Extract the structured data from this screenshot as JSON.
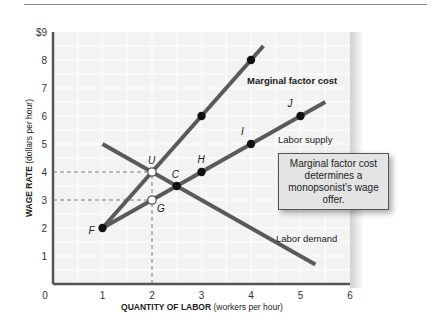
{
  "chart_data": {
    "type": "line",
    "title": "",
    "xlabel": "QUANTITY OF LABOR (workers per hour)",
    "xlabel_bold": "QUANTITY OF LABOR",
    "xlabel_rest": " (workers per hour)",
    "ylabel": "WAGE RATE (dollars per hour)",
    "ylabel_bold": "WAGE RATE",
    "ylabel_rest": " (dollars per hour)",
    "xlim": [
      0,
      6
    ],
    "ylim": [
      0,
      9
    ],
    "x_ticks": [
      "0",
      "1",
      "2",
      "3",
      "4",
      "5",
      "6"
    ],
    "y_ticks": [
      "0",
      "1",
      "2",
      "3",
      "4",
      "5",
      "6",
      "7",
      "8",
      "$9"
    ],
    "grid": true,
    "series": [
      {
        "name": "Marginal factor cost",
        "points": [
          [
            1,
            2
          ],
          [
            2,
            4
          ],
          [
            3,
            6
          ],
          [
            4,
            8
          ],
          [
            4.25,
            8.5
          ]
        ],
        "markers": [
          [
            3,
            6
          ],
          [
            4,
            8
          ]
        ]
      },
      {
        "name": "Labor supply",
        "points": [
          [
            1,
            2
          ],
          [
            2,
            3
          ],
          [
            3,
            4
          ],
          [
            4,
            5
          ],
          [
            5,
            6
          ],
          [
            5.5,
            6.5
          ]
        ],
        "markers": [
          [
            1,
            2
          ],
          [
            3,
            4
          ],
          [
            4,
            5
          ],
          [
            5,
            6
          ]
        ]
      },
      {
        "name": "Labor demand",
        "points": [
          [
            1,
            5
          ],
          [
            2,
            4
          ],
          [
            2.5,
            3.5
          ],
          [
            5.3,
            0.7
          ]
        ],
        "markers": []
      }
    ],
    "labeled_points": [
      {
        "label": "F",
        "x": 1,
        "y": 2
      },
      {
        "label": "G",
        "x": 2,
        "y": 3,
        "open": true
      },
      {
        "label": "U",
        "x": 2,
        "y": 4,
        "open": true
      },
      {
        "label": "C",
        "x": 2.5,
        "y": 3.5
      },
      {
        "label": "H",
        "x": 3,
        "y": 4
      },
      {
        "label": "I",
        "x": 4,
        "y": 5
      },
      {
        "label": "J",
        "x": 5,
        "y": 6
      }
    ],
    "reference_lines": [
      {
        "type": "dashed",
        "from": [
          0,
          4
        ],
        "to": [
          2,
          4
        ]
      },
      {
        "type": "dashed",
        "from": [
          0,
          3
        ],
        "to": [
          2,
          3
        ]
      },
      {
        "type": "dashed",
        "from": [
          2,
          0
        ],
        "to": [
          2,
          4
        ]
      }
    ],
    "annotations": [
      "Marginal factor cost determines a monopsonist's wage offer."
    ]
  },
  "labels": {
    "mfc": "Marginal factor cost",
    "supply": "Labor supply",
    "demand": "Labor demand",
    "callout": "Marginal factor cost determines a monopsonist’s wage offer."
  }
}
